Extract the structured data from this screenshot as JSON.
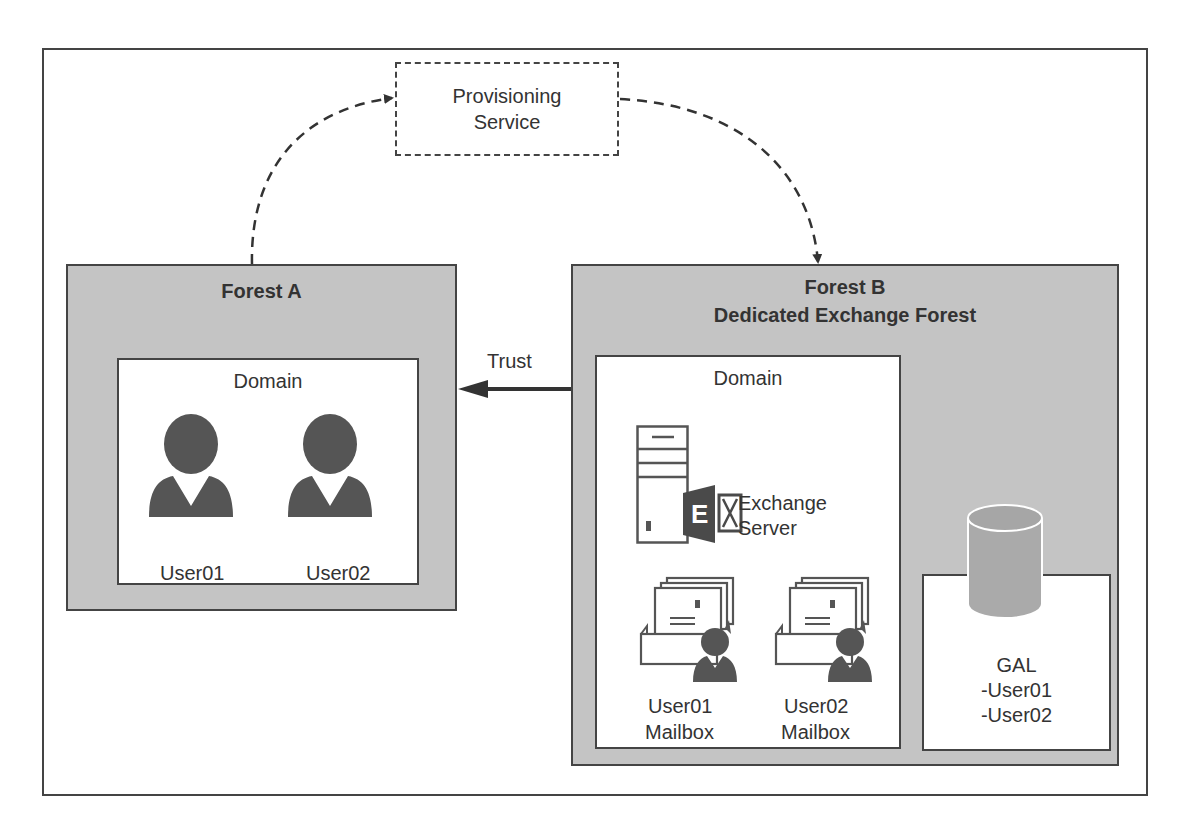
{
  "diagram": {
    "provisioning_service": {
      "line1": "Provisioning",
      "line2": "Service"
    },
    "forest_a": {
      "title": "Forest A",
      "domain_label": "Domain",
      "users": [
        {
          "label": "User01"
        },
        {
          "label": "User02"
        }
      ]
    },
    "trust": {
      "label": "Trust"
    },
    "forest_b": {
      "title_line1": "Forest B",
      "title_line2": "Dedicated Exchange Forest",
      "domain_label": "Domain",
      "exchange_server": {
        "line1": "Exchange",
        "line2": "Server"
      },
      "mailboxes": [
        {
          "line1": "User01",
          "line2": "Mailbox"
        },
        {
          "line1": "User02",
          "line2": "Mailbox"
        }
      ],
      "gal": {
        "title": "GAL",
        "entries": [
          "-User01",
          "-User02"
        ]
      }
    },
    "colors": {
      "forest_fill": "#c4c4c4",
      "border": "#444444",
      "icon": "#555555",
      "exchange_accent": "#4a4a4a"
    }
  }
}
